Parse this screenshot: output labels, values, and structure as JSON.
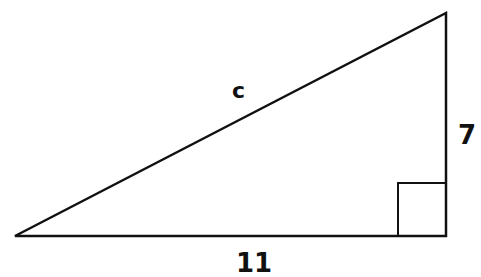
{
  "diagram": {
    "type": "right-triangle",
    "labels": {
      "hypotenuse": "c",
      "vertical_leg": "7",
      "horizontal_leg": "11"
    },
    "right_angle_marker": true,
    "stroke_color": "#111111",
    "background": "#ffffff"
  }
}
